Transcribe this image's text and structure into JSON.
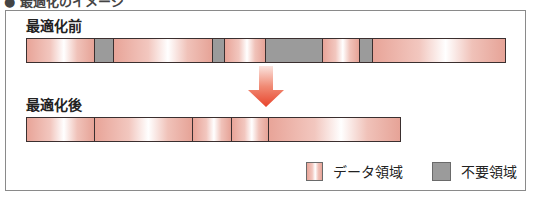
{
  "heading": {
    "text": "● 最適化のイメージ"
  },
  "before": {
    "label": "最適化前",
    "segments": [
      {
        "type": "data",
        "width": 68
      },
      {
        "type": "waste",
        "width": 19
      },
      {
        "type": "data",
        "width": 99
      },
      {
        "type": "waste",
        "width": 12
      },
      {
        "type": "data",
        "width": 41
      },
      {
        "type": "waste",
        "width": 58
      },
      {
        "type": "data",
        "width": 37
      },
      {
        "type": "waste",
        "width": 13
      },
      {
        "type": "data",
        "width": 132
      }
    ]
  },
  "after": {
    "label": "最適化後",
    "segments": [
      {
        "type": "data",
        "width": 68
      },
      {
        "type": "data",
        "width": 98
      },
      {
        "type": "data",
        "width": 40
      },
      {
        "type": "data",
        "width": 37
      },
      {
        "type": "data",
        "width": 131
      }
    ]
  },
  "legend": [
    {
      "label": "データ領域",
      "type": "data"
    },
    {
      "label": "不要領域",
      "type": "waste"
    }
  ],
  "colors": {
    "data_edge": "#e8a498",
    "waste": "#9b9b9b",
    "arrow_top": "#f7d3cc",
    "arrow_bottom": "#e8442c",
    "border": "#3a2f2f"
  }
}
